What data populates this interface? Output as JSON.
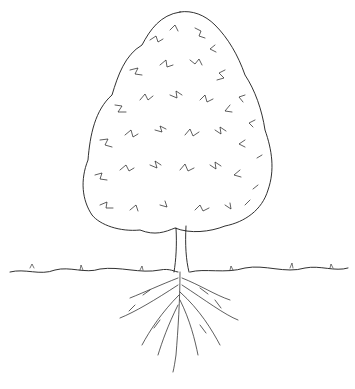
{
  "image": {
    "subject": "Line drawing of a deciduous tree showing crown, trunk, ground line and root system",
    "colors": {
      "background": "#ffffff",
      "ink": "#1a1a1a"
    },
    "parts": [
      "crown",
      "trunk",
      "ground-line",
      "roots"
    ]
  }
}
